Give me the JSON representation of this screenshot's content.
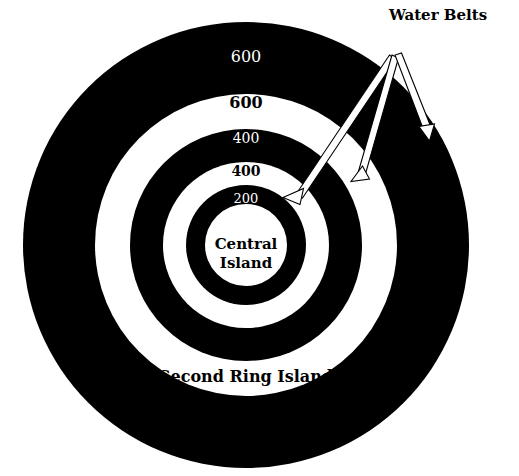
{
  "diagram": {
    "title_hidden": "",
    "geometry": {
      "center_x": 246,
      "center_y": 245,
      "radii": [
        223,
        151,
        116,
        83,
        60,
        41
      ]
    },
    "colors": {
      "land": "#ffffff",
      "water": "#000000",
      "background": "#ffffff",
      "callout_stroke": "#000000"
    },
    "regions": [
      {
        "name": "outer-water-belt",
        "fill": "water",
        "r_outer": 223,
        "r_inner": 151
      },
      {
        "name": "second-ring-island",
        "fill": "land",
        "r_outer": 151,
        "r_inner": 116
      },
      {
        "name": "middle-water-belt",
        "fill": "water",
        "r_outer": 116,
        "r_inner": 83
      },
      {
        "name": "first-ring-island",
        "fill": "land",
        "r_outer": 83,
        "r_inner": 60
      },
      {
        "name": "inner-water-belt",
        "fill": "water",
        "r_outer": 60,
        "r_inner": 41
      },
      {
        "name": "central-island",
        "fill": "land",
        "r_outer": 41,
        "r_inner": 0
      }
    ],
    "island_labels": {
      "central": "Central\nIsland",
      "central_line1": "Central",
      "central_line2": "Island",
      "first_ring": "First Ring Island",
      "second_ring": "Second Ring Island"
    },
    "measurements": [
      {
        "id": "m-600-outer",
        "value": "600",
        "on": "black",
        "x": 246,
        "y": 62
      },
      {
        "id": "m-600-inner",
        "value": "600",
        "on": "white",
        "x": 246,
        "y": 108
      },
      {
        "id": "m-400-outer",
        "value": "400",
        "on": "black",
        "x": 246,
        "y": 143
      },
      {
        "id": "m-400-inner",
        "value": "400",
        "on": "white",
        "x": 246,
        "y": 176
      },
      {
        "id": "m-200-inner",
        "value": "200",
        "on": "black",
        "x": 246,
        "y": 203
      }
    ],
    "callout": {
      "label": "Water Belts",
      "label_x": 438,
      "label_y": 20,
      "arrows": [
        {
          "id": "arrow-to-inner-belt",
          "from_x": 388,
          "from_y": 56,
          "to_x": 284,
          "to_y": 197
        },
        {
          "id": "arrow-to-middle-belt",
          "from_x": 391,
          "from_y": 56,
          "to_x": 352,
          "to_y": 180
        },
        {
          "id": "arrow-to-outer-belt",
          "from_x": 394,
          "from_y": 56,
          "to_x": 429,
          "to_y": 140
        }
      ]
    }
  }
}
